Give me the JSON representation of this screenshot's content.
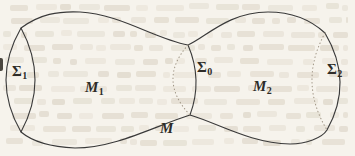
{
  "figure": {
    "labels": [
      {
        "name": "sigma-1",
        "base": "Σ",
        "sub": "1"
      },
      {
        "name": "m-1",
        "base": "M",
        "sub": "1"
      },
      {
        "name": "sigma-0",
        "base": "Σ",
        "sub": "0"
      },
      {
        "name": "m-2",
        "base": "M",
        "sub": "2"
      },
      {
        "name": "sigma-2",
        "base": "Σ",
        "sub": "2"
      },
      {
        "name": "m",
        "base": "M",
        "sub": ""
      }
    ],
    "colors": {
      "outline": "#3a3a3a",
      "dotted_line": "#a19787",
      "paper_background": "#f6f3ec",
      "label_ink": "#2e2c28"
    }
  }
}
